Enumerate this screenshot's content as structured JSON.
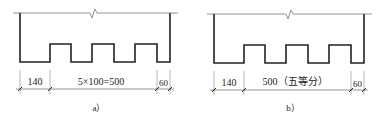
{
  "panels": [
    {
      "id": "a",
      "caption": "a）",
      "dims": {
        "left": "140",
        "middle": "5×100=500",
        "right": "60"
      }
    },
    {
      "id": "b",
      "caption": "b）",
      "dims": {
        "left": "140",
        "middle": "500（五等分）",
        "right": "60"
      }
    }
  ],
  "colors": {
    "outline": "#222222",
    "thin": "#666666",
    "dim": "#555555"
  }
}
